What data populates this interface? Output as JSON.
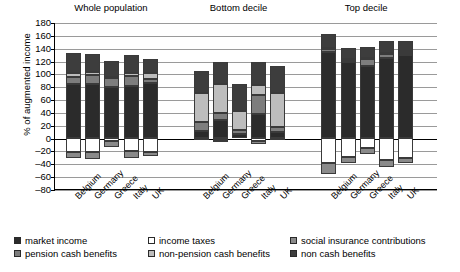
{
  "chart_data": {
    "type": "bar",
    "subtype": "stacked-bar-grouped",
    "title": "",
    "xlabel": "",
    "ylabel": "% of augmented income",
    "ylim": [
      -80,
      180
    ],
    "ytick_step": 20,
    "yticks": [
      180,
      160,
      140,
      120,
      100,
      80,
      60,
      40,
      20,
      0,
      -20,
      -40,
      -60,
      -80
    ],
    "grid": true,
    "grid_axis": "y",
    "legend_position": "bottom",
    "groups": [
      "Whole population",
      "Bottom decile",
      "Top decile"
    ],
    "categories": [
      "Belgium",
      "Germany",
      "Greece",
      "Italy",
      "UK"
    ],
    "series": [
      {
        "name": "market income",
        "color": "#2b2b2b",
        "sign": "positive",
        "values": {
          "Whole population": [
            83,
            84,
            79,
            80,
            85
          ],
          "Bottom decile": [
            11,
            27,
            5,
            36,
            9
          ],
          "Top decile": [
            133,
            117,
            112,
            124,
            129
          ]
        }
      },
      {
        "name": "pension cash benefits",
        "color": "#7d7d7d",
        "sign": "positive",
        "values": {
          "Whole population": [
            12,
            13,
            14,
            16,
            7
          ],
          "Bottom decile": [
            13,
            11,
            7,
            30,
            8
          ],
          "Top decile": [
            5,
            4,
            10,
            6,
            3
          ]
        }
      },
      {
        "name": "non-pension cash benefits",
        "color": "#bdbdbd",
        "sign": "positive",
        "values": {
          "Whole population": [
            6,
            5,
            2,
            4,
            9
          ],
          "Bottom decile": [
            45,
            46,
            29,
            16,
            52
          ],
          "Top decile": [
            2,
            2,
            2,
            2,
            3
          ]
        }
      },
      {
        "name": "non cash benefits",
        "color": "#3d3d3d",
        "sign": "positive",
        "values": {
          "Whole population": [
            31,
            28,
            25,
            29,
            22
          ],
          "Bottom decile": [
            35,
            34,
            42,
            36,
            42
          ],
          "Top decile": [
            22,
            17,
            17,
            18,
            15
          ]
        }
      },
      {
        "name": "income taxes",
        "color": "#ffffff",
        "sign": "negative",
        "values": {
          "Whole population": [
            -22,
            -22,
            -6,
            -21,
            -23
          ],
          "Bottom decile": [
            -1,
            -3,
            0,
            -6,
            -1
          ],
          "Top decile": [
            -40,
            -30,
            -16,
            -35,
            -32
          ]
        }
      },
      {
        "name": "social insurance contributions",
        "color": "#8a8a8a",
        "sign": "negative",
        "values": {
          "Whole population": [
            -10,
            -12,
            -9,
            -10,
            -5
          ],
          "Bottom decile": [
            -1,
            -3,
            0,
            -4,
            -1
          ],
          "Top decile": [
            -16,
            -10,
            -9,
            -11,
            -7
          ]
        }
      }
    ],
    "bar_totals": {
      "Whole population": [
        132,
        130,
        120,
        129,
        123
      ],
      "Bottom decile": [
        104,
        118,
        83,
        118,
        111
      ],
      "Top decile": [
        162,
        140,
        141,
        150,
        150
      ]
    },
    "legend": [
      {
        "label": "market income",
        "color": "#2b2b2b",
        "icon": "swatch-market-income"
      },
      {
        "label": "income taxes",
        "color": "#ffffff",
        "icon": "swatch-income-taxes"
      },
      {
        "label": "social insurance contributions",
        "color": "#8a8a8a",
        "icon": "swatch-social-insurance-contributions"
      },
      {
        "label": "pension cash benefits",
        "color": "#7d7d7d",
        "icon": "swatch-pension-cash-benefits"
      },
      {
        "label": "non-pension cash benefits",
        "color": "#bdbdbd",
        "icon": "swatch-non-pension-cash-benefits"
      },
      {
        "label": "non cash benefits",
        "color": "#3d3d3d",
        "icon": "swatch-non-cash-benefits"
      }
    ]
  }
}
